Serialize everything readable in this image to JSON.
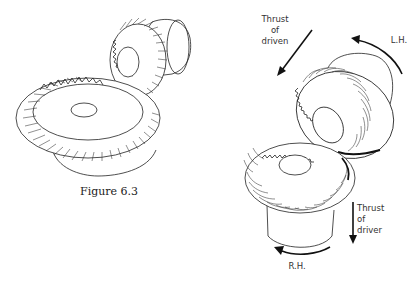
{
  "left_figure": {
    "title": "Straight bevel gear pair",
    "caption": "Figure 6.3",
    "gears": [
      {
        "name": "large-bevel-gear",
        "teeth_style": "straight"
      },
      {
        "name": "pinion-bevel-gear",
        "teeth_style": "straight"
      }
    ]
  },
  "right_figure": {
    "title": "Spiral bevel gear pair",
    "labels": {
      "thrust_driven_line1": "Thrust",
      "thrust_driven_line2": "of",
      "thrust_driven_line3": "driven",
      "left_hand": "L.H.",
      "thrust_driver_line1": "Thrust",
      "thrust_driver_line2": "of",
      "thrust_driver_line3": "driver",
      "right_hand": "R.H."
    },
    "gears": [
      {
        "name": "driven-gear",
        "hand": "L.H.",
        "teeth_style": "spiral"
      },
      {
        "name": "driver-gear",
        "hand": "R.H.",
        "teeth_style": "spiral"
      }
    ]
  },
  "colors": {
    "background": "#ffffff",
    "ink": "#1a1a1a"
  }
}
